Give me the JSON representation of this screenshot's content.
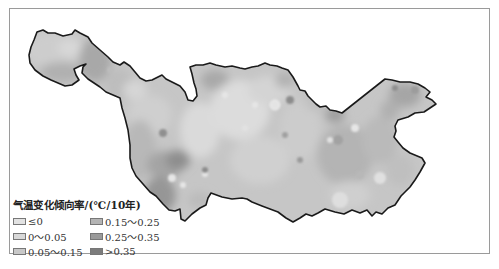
{
  "map": {
    "title": "气温变化倾向率/(℃/10年)",
    "region": "Yangtze River Basin",
    "colors": {
      "boundary": "#1a1a1a",
      "frame": "#9a9a9a",
      "background": "#ffffff"
    }
  },
  "legend": {
    "title": "气温变化倾向率/(℃/10年)",
    "items": [
      {
        "label": "≤0",
        "color": "#e2e2e2"
      },
      {
        "label": "0.15～0.25",
        "color": "#b4b4b4"
      },
      {
        "label": "0～0.05",
        "color": "#d8d8d8"
      },
      {
        "label": "0.25～0.35",
        "color": "#9a9a9a"
      },
      {
        "label": "0.05～0.15",
        "color": "#c8c8c8"
      },
      {
        "label": ">0.35",
        "color": "#7c7c7c"
      }
    ]
  }
}
